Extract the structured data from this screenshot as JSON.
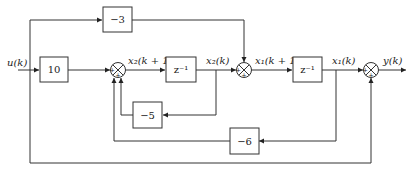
{
  "diagram": {
    "type": "block-diagram",
    "input": {
      "label": "u(k)"
    },
    "output": {
      "label": "y(k)"
    },
    "blocks": [
      {
        "id": "gain10",
        "label": "10"
      },
      {
        "id": "gain-3",
        "label": "−3"
      },
      {
        "id": "delay2",
        "label": "z⁻¹"
      },
      {
        "id": "gain-5",
        "label": "−5"
      },
      {
        "id": "delay1",
        "label": "z⁻¹"
      },
      {
        "id": "gain-6",
        "label": "−6"
      }
    ],
    "signals": [
      {
        "id": "x2_next",
        "label": "x₂(k + 1)"
      },
      {
        "id": "x2",
        "label": "x₂(k)"
      },
      {
        "id": "x1_next",
        "label": "x₁(k + 1)"
      },
      {
        "id": "x1",
        "label": "x₁(k)"
      }
    ],
    "summers": [
      {
        "id": "sum1",
        "signs": [
          "+",
          "+",
          "+"
        ]
      },
      {
        "id": "sum2",
        "signs": [
          "+",
          "+",
          "+"
        ]
      },
      {
        "id": "sum3",
        "signs": [
          "+",
          "+",
          "+"
        ]
      }
    ],
    "connections": [
      "u(k) → 10 → sum1",
      "u(k) → −3 → sum2",
      "u(k) → sum3 (bottom feedthrough)",
      "sum1 → z⁻¹ → x₂(k) → sum2",
      "x₂(k) → −5 → sum1",
      "sum2 → z⁻¹ → x₁(k) → sum3 → y(k)",
      "x₁(k) → −6 → sum1"
    ]
  }
}
